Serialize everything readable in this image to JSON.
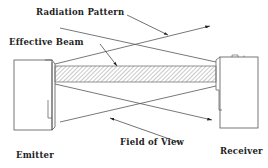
{
  "diagram": {
    "labels": {
      "radiation_pattern": "Radiation Pattern",
      "effective_beam": "Effective Beam",
      "field_of_view": "Field of View",
      "emitter": "Emitter",
      "receiver": "Receiver"
    },
    "colors": {
      "line": "#444444",
      "hatch": "#888888",
      "background": "#ffffff"
    }
  }
}
